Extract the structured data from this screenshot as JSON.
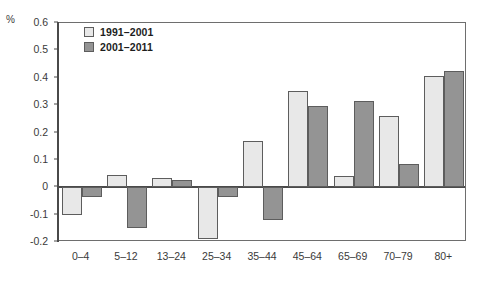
{
  "chart_data": {
    "type": "bar",
    "title": "",
    "xlabel": "",
    "ylabel": "%",
    "unit_label": "%",
    "ylim": [
      -0.2,
      0.6
    ],
    "yticks": [
      0.6,
      0.5,
      0.4,
      0.3,
      0.2,
      0.1,
      0,
      -0.1,
      -0.2
    ],
    "ytick_labels": [
      "0.6",
      "0.5",
      "0.4",
      "0.3",
      "0.2",
      "0.1",
      "0",
      "-0.1",
      "-0.2"
    ],
    "grid": false,
    "legend_position": "top-left-inside",
    "categories": [
      "0–4",
      "5–12",
      "13–24",
      "25–34",
      "35–44",
      "45–64",
      "65–69",
      "70–79",
      "80+"
    ],
    "series": [
      {
        "name": "1991–2001",
        "color": "#e8e8e8",
        "values": [
          -0.1,
          0.045,
          0.035,
          -0.19,
          0.17,
          0.35,
          0.04,
          0.26,
          0.405
        ]
      },
      {
        "name": "2001–2011",
        "color": "#949494",
        "values": [
          -0.035,
          -0.15,
          0.025,
          -0.035,
          -0.12,
          0.295,
          0.315,
          0.085,
          0.425
        ]
      }
    ]
  },
  "style": {
    "series_light": "#e8e8e8",
    "series_dark": "#949494",
    "bar_outline": "#5d5d5d",
    "axis_color": "#4a4a4a",
    "frame_color": "#6e6e6e",
    "text_color": "#3a3a3a",
    "background": "#ffffff"
  }
}
